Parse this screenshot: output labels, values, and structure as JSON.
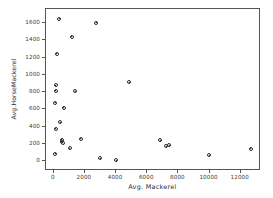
{
  "chart_data": {
    "type": "scatter",
    "title": "",
    "xlabel": "Avg. Mackerel",
    "ylabel": "Avg.HorseMackerel",
    "xlim": [
      -500,
      13300
    ],
    "ylim": [
      -110,
      1760
    ],
    "xticks": [
      0,
      2000,
      4000,
      6000,
      8000,
      10000,
      12000
    ],
    "yticks": [
      0,
      200,
      400,
      600,
      800,
      1000,
      1200,
      1400,
      1600
    ],
    "grid": false,
    "legend": null,
    "marker": "circle-open",
    "marker_color": "#2b2b2b",
    "points": [
      {
        "x": 340,
        "y": 1645
      },
      {
        "x": 2730,
        "y": 1600
      },
      {
        "x": 1140,
        "y": 1440
      },
      {
        "x": 200,
        "y": 1245
      },
      {
        "x": 120,
        "y": 880
      },
      {
        "x": 120,
        "y": 815
      },
      {
        "x": 1390,
        "y": 810
      },
      {
        "x": 4840,
        "y": 915
      },
      {
        "x": 80,
        "y": 680
      },
      {
        "x": 650,
        "y": 620
      },
      {
        "x": 430,
        "y": 450
      },
      {
        "x": 110,
        "y": 375
      },
      {
        "x": 520,
        "y": 250
      },
      {
        "x": 500,
        "y": 230
      },
      {
        "x": 560,
        "y": 215
      },
      {
        "x": 1730,
        "y": 265
      },
      {
        "x": 1020,
        "y": 150
      },
      {
        "x": 80,
        "y": 90
      },
      {
        "x": 2980,
        "y": 40
      },
      {
        "x": 4020,
        "y": 15
      },
      {
        "x": 6830,
        "y": 245
      },
      {
        "x": 7220,
        "y": 175
      },
      {
        "x": 7420,
        "y": 185
      },
      {
        "x": 9990,
        "y": 70
      },
      {
        "x": 12650,
        "y": 145
      }
    ]
  }
}
